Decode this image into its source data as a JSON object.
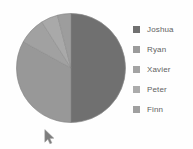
{
  "canvas": {
    "width": 193,
    "height": 149,
    "background": "#fefefe"
  },
  "legend": {
    "position": "right",
    "items": [
      {
        "label": "Joshua",
        "color": "#6e6e6e"
      },
      {
        "label": "Ryan",
        "color": "#9a9a9a"
      },
      {
        "label": "Xavier",
        "color": "#a2a2a2"
      },
      {
        "label": "Peter",
        "color": "#aaaaaa"
      },
      {
        "label": "Finn",
        "color": "#9e9e9e"
      }
    ]
  },
  "cursor": {
    "name": "mouse-pointer",
    "x": 44,
    "y": 129
  },
  "chart_data": {
    "type": "pie",
    "title": "",
    "categories": [
      "Joshua",
      "Ryan",
      "Xavier",
      "Peter",
      "Finn"
    ],
    "values": [
      50,
      33,
      8,
      5,
      4
    ],
    "unit": "percent",
    "colors": [
      "#6e6e6e",
      "#969696",
      "#a0a0a0",
      "#a8a8a8",
      "#9c9c9c"
    ],
    "start_angle": 0,
    "direction": "clockwise",
    "legend_position": "right",
    "labels_shown": false,
    "center": {
      "x": 71,
      "y": 68
    },
    "radius": 55
  }
}
